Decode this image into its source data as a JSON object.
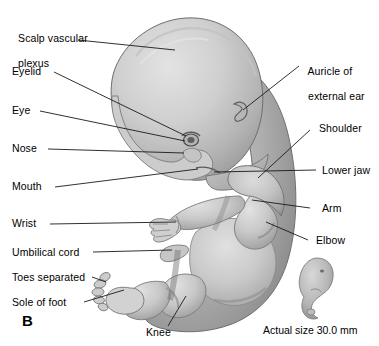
{
  "figure": {
    "panel_label": "B",
    "caption": "Actual size 30.0 mm",
    "colors": {
      "background": "#ffffff",
      "body_light": "#d9d9d9",
      "body_mid": "#bdbdbd",
      "body_dark": "#9a9a9a",
      "body_shadow": "#7d7d7d",
      "outline": "#6e6e6e",
      "leader_line": "#1a1a1a",
      "text": "#000000"
    }
  },
  "labels_left": [
    {
      "id": "scalp-vascular-plexus",
      "line1": "Scalp vascular",
      "line2": "plexus"
    },
    {
      "id": "eyelid",
      "line1": "Eyelid",
      "line2": ""
    },
    {
      "id": "eye",
      "line1": "Eye",
      "line2": ""
    },
    {
      "id": "nose",
      "line1": "Nose",
      "line2": ""
    },
    {
      "id": "mouth",
      "line1": "Mouth",
      "line2": ""
    },
    {
      "id": "wrist",
      "line1": "Wrist",
      "line2": ""
    },
    {
      "id": "umbilical-cord",
      "line1": "Umbilical cord",
      "line2": ""
    },
    {
      "id": "toes-separated",
      "line1": "Toes separated",
      "line2": ""
    },
    {
      "id": "sole-of-foot",
      "line1": "Sole of foot",
      "line2": ""
    }
  ],
  "labels_right": [
    {
      "id": "auricle-of-external-ear",
      "line1": "Auricle of",
      "line2": "external ear"
    },
    {
      "id": "shoulder",
      "line1": "Shoulder",
      "line2": ""
    },
    {
      "id": "lower-jaw",
      "line1": "Lower jaw",
      "line2": ""
    },
    {
      "id": "arm",
      "line1": "Arm",
      "line2": ""
    },
    {
      "id": "elbow",
      "line1": "Elbow",
      "line2": ""
    }
  ],
  "labels_bottom": [
    {
      "id": "knee",
      "line1": "Knee",
      "line2": ""
    }
  ]
}
